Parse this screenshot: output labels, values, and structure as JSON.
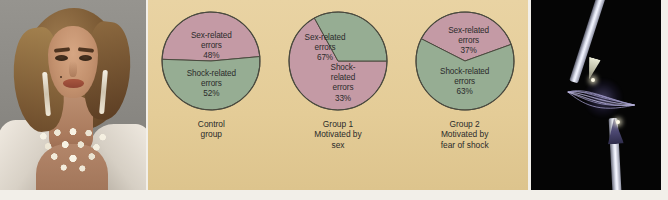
{
  "figure": {
    "background_color": "#e6cf9c",
    "pink_color": "#c49aa5",
    "green_color": "#96ad93",
    "outline_color": "#4a4a3f",
    "text_color": "#2b2b2b"
  },
  "left_photo": {
    "alt": "portrait-photograph-of-woman-with-pearl-necklace-and-long-earrings",
    "background_color": "#8c8b88"
  },
  "right_photo": {
    "alt": "electric-spark-arc-between-two-electrodes-on-black-background",
    "background_color": "#050505"
  },
  "chart_data": [
    {
      "type": "pie",
      "title": "Control group",
      "caption_lines": [
        "Control",
        "group"
      ],
      "categories": [
        "Sex-related errors",
        "Shock-related errors"
      ],
      "values": [
        48,
        52
      ],
      "labels": [
        {
          "lines": [
            "Sex-related",
            "errors",
            "48%"
          ],
          "percent": "48%"
        },
        {
          "lines": [
            "Shock-related",
            "errors",
            "52%"
          ],
          "percent": "52%"
        }
      ],
      "colors": [
        "#c49aa5",
        "#96ad93"
      ],
      "start_angle_deg": 272,
      "legend": "none"
    },
    {
      "type": "pie",
      "title": "Group 1 Motivated by sex",
      "caption_lines": [
        "Group 1",
        "Motivated by",
        "sex"
      ],
      "categories": [
        "Sex-related errors",
        "Shock-related errors"
      ],
      "values": [
        67,
        33
      ],
      "labels": [
        {
          "lines": [
            "Sex-related",
            "errors",
            "67%"
          ],
          "percent": "67%"
        },
        {
          "lines": [
            "Shock-",
            "related",
            "errors",
            "33%"
          ],
          "percent": "33%"
        }
      ],
      "colors": [
        "#c49aa5",
        "#96ad93"
      ],
      "start_angle_deg": 90,
      "legend": "none"
    },
    {
      "type": "pie",
      "title": "Group 2 Motivated by fear of shock",
      "caption_lines": [
        "Group 2",
        "Motivated by",
        "fear of shock"
      ],
      "categories": [
        "Sex-related errors",
        "Shock-related errors"
      ],
      "values": [
        37,
        63
      ],
      "labels": [
        {
          "lines": [
            "Sex-related",
            "errors",
            "37%"
          ],
          "percent": "37%"
        },
        {
          "lines": [
            "Shock-related",
            "errors",
            "63%"
          ],
          "percent": "63%"
        }
      ],
      "colors": [
        "#c49aa5",
        "#96ad93"
      ],
      "start_angle_deg": 297,
      "legend": "none"
    }
  ]
}
